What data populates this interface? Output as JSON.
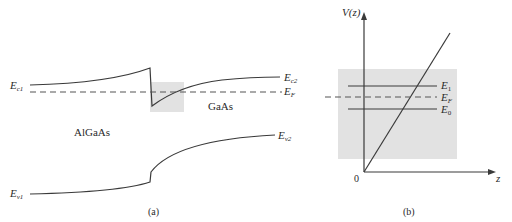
{
  "panel_a": {
    "caption": "(a)",
    "regions": {
      "left": "AlGaAs",
      "right": "GaAs"
    },
    "labels": {
      "Ec1": {
        "main": "E",
        "sub": "c1"
      },
      "Ec2": {
        "main": "E",
        "sub": "c2"
      },
      "EF": {
        "main": "E",
        "sub": "F"
      },
      "Ev1": {
        "main": "E",
        "sub": "v1"
      },
      "Ev2": {
        "main": "E",
        "sub": "v2"
      }
    }
  },
  "panel_b": {
    "caption": "(b)",
    "y_axis_label": "V(z)",
    "x_axis_label": "z",
    "origin_label": "0",
    "levels": {
      "E1": {
        "main": "E",
        "sub": "1"
      },
      "EF": {
        "main": "E",
        "sub": "F"
      },
      "E0": {
        "main": "E",
        "sub": "0"
      }
    }
  },
  "colors": {
    "line": "#3a3a3a",
    "shade": "#e2e2e2"
  }
}
